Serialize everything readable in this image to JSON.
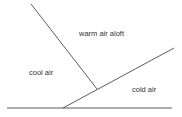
{
  "diagram": {
    "labels": {
      "warm_air": "warm air aloft",
      "cool_air": "cool air",
      "cold_air": "cold air"
    },
    "colors": {
      "line": "#333333",
      "text": "#333333"
    }
  }
}
